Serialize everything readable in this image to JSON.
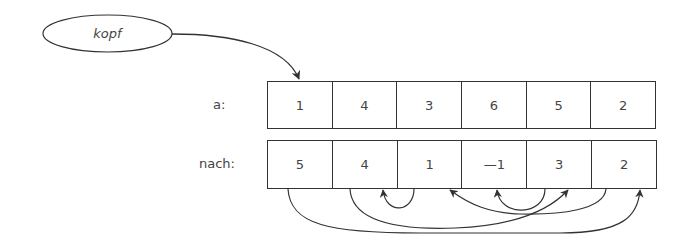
{
  "head": {
    "label": "kopf",
    "points_to_index": 0
  },
  "rows": [
    {
      "label": "a:",
      "values": [
        "1",
        "4",
        "3",
        "6",
        "5",
        "2"
      ]
    },
    {
      "label": "nach:",
      "values": [
        "5",
        "4",
        "1",
        "—1",
        "3",
        "2"
      ]
    }
  ],
  "links": [
    {
      "from": 0,
      "to": 5
    },
    {
      "from": 1,
      "to": 4
    },
    {
      "from": 2,
      "to": 1
    },
    {
      "from": 5,
      "to": 2
    },
    {
      "from": 4,
      "to": 3
    }
  ],
  "colors": {
    "stroke": "#333333",
    "text": "#444444"
  }
}
